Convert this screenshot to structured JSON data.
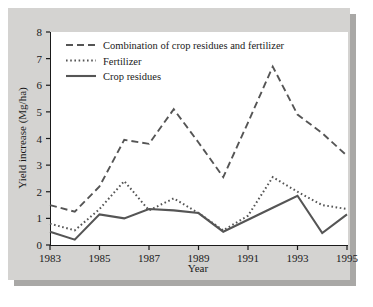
{
  "chart_data": {
    "type": "line",
    "title": "",
    "xlabel": "Year",
    "ylabel": "Yield increase (Mg/ha)",
    "xlim": [
      1983,
      1995
    ],
    "ylim": [
      0,
      8
    ],
    "x": [
      1983,
      1984,
      1985,
      1986,
      1987,
      1988,
      1989,
      1990,
      1991,
      1992,
      1993,
      1994,
      1995
    ],
    "xticks": [
      1983,
      1985,
      1987,
      1989,
      1991,
      1993,
      1995
    ],
    "xtick_labels": [
      "1983",
      "1985",
      "1987",
      "1989",
      "1991",
      "1993",
      "1995"
    ],
    "yticks": [
      0,
      1,
      2,
      3,
      4,
      5,
      6,
      7,
      8
    ],
    "ytick_labels": [
      "0",
      "1",
      "2",
      "3",
      "4",
      "5",
      "6",
      "7",
      "8"
    ],
    "grid": false,
    "legend_position": "upper left",
    "series": [
      {
        "name": "Combination of crop residues and fertilizer",
        "style": "dashed",
        "values": [
          1.5,
          1.25,
          2.2,
          3.95,
          3.8,
          5.1,
          3.85,
          2.55,
          4.6,
          6.7,
          4.9,
          4.2,
          3.35
        ]
      },
      {
        "name": "Fertilizer",
        "style": "dotted",
        "values": [
          0.8,
          0.55,
          1.35,
          2.4,
          1.3,
          1.75,
          1.2,
          0.55,
          1.1,
          2.55,
          2.0,
          1.5,
          1.35
        ]
      },
      {
        "name": "Crop residues",
        "style": "solid",
        "values": [
          0.5,
          0.2,
          1.15,
          1.0,
          1.35,
          1.3,
          1.2,
          0.5,
          0.95,
          1.4,
          1.85,
          0.45,
          1.15
        ]
      }
    ]
  },
  "colors": {
    "panel_background": "#d4d3d1",
    "plot_background": "#ffffff",
    "axis": "#1a1a1a",
    "series_line": "#555555",
    "shadow": "#a9a8a6"
  },
  "legend": {
    "items": [
      {
        "label": "Combination of crop residues and fertilizer",
        "style": "dashed"
      },
      {
        "label": "Fertilizer",
        "style": "dotted"
      },
      {
        "label": "Crop residues",
        "style": "solid"
      }
    ]
  }
}
